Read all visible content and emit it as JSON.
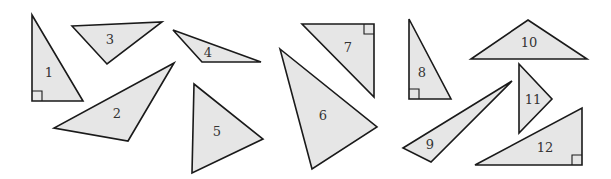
{
  "figure": {
    "width": 611,
    "height": 179,
    "background": "#ffffff",
    "fill": "#e6e6e6",
    "stroke": "#1a1a1a",
    "stroke_width": 1.6,
    "triangles": [
      {
        "label": "1",
        "points": [
          [
            32,
            15
          ],
          [
            32,
            101
          ],
          [
            83,
            101
          ]
        ],
        "label_pos": [
          49,
          77
        ],
        "right_angle": {
          "corner": [
            32,
            101
          ],
          "dir": [
            [
              1,
              0
            ],
            [
              0,
              -1
            ]
          ]
        }
      },
      {
        "label": "2",
        "points": [
          [
            174,
            63
          ],
          [
            54,
            128
          ],
          [
            128,
            141
          ]
        ],
        "label_pos": [
          117,
          118
        ],
        "right_angle": null
      },
      {
        "label": "3",
        "points": [
          [
            72,
            26
          ],
          [
            162,
            22
          ],
          [
            107,
            64
          ]
        ],
        "label_pos": [
          110,
          44
        ],
        "right_angle": null
      },
      {
        "label": "4",
        "points": [
          [
            173,
            30
          ],
          [
            261,
            62
          ],
          [
            202,
            62
          ]
        ],
        "label_pos": [
          208,
          57
        ],
        "right_angle": null
      },
      {
        "label": "5",
        "points": [
          [
            194,
            84
          ],
          [
            263,
            139
          ],
          [
            192,
            173
          ]
        ],
        "label_pos": [
          217,
          136
        ],
        "right_angle": null
      },
      {
        "label": "6",
        "points": [
          [
            280,
            49
          ],
          [
            377,
            127
          ],
          [
            312,
            169
          ]
        ],
        "label_pos": [
          323,
          120
        ],
        "right_angle": null
      },
      {
        "label": "7",
        "points": [
          [
            302,
            24
          ],
          [
            374,
            24
          ],
          [
            374,
            97
          ]
        ],
        "label_pos": [
          348,
          52
        ],
        "right_angle": {
          "corner": [
            374,
            24
          ],
          "dir": [
            [
              -1,
              0
            ],
            [
              0,
              1
            ]
          ]
        }
      },
      {
        "label": "8",
        "points": [
          [
            409,
            19
          ],
          [
            409,
            99
          ],
          [
            451,
            99
          ]
        ],
        "label_pos": [
          422,
          77
        ],
        "right_angle": {
          "corner": [
            409,
            99
          ],
          "dir": [
            [
              1,
              0
            ],
            [
              0,
              -1
            ]
          ]
        }
      },
      {
        "label": "9",
        "points": [
          [
            512,
            81
          ],
          [
            403,
            148
          ],
          [
            431,
            162
          ]
        ],
        "label_pos": [
          430,
          149
        ],
        "right_angle": null
      },
      {
        "label": "10",
        "points": [
          [
            528,
            20
          ],
          [
            587,
            59
          ],
          [
            471,
            59
          ]
        ],
        "label_pos": [
          529,
          47
        ],
        "right_angle": null
      },
      {
        "label": "11",
        "points": [
          [
            519,
            64
          ],
          [
            552,
            99
          ],
          [
            519,
            133
          ]
        ],
        "label_pos": [
          533,
          104
        ],
        "right_angle": null
      },
      {
        "label": "12",
        "points": [
          [
            582,
            108
          ],
          [
            582,
            165
          ],
          [
            475,
            165
          ]
        ],
        "label_pos": [
          545,
          152
        ],
        "right_angle": {
          "corner": [
            582,
            165
          ],
          "dir": [
            [
              -1,
              0
            ],
            [
              0,
              -1
            ]
          ]
        }
      }
    ]
  }
}
